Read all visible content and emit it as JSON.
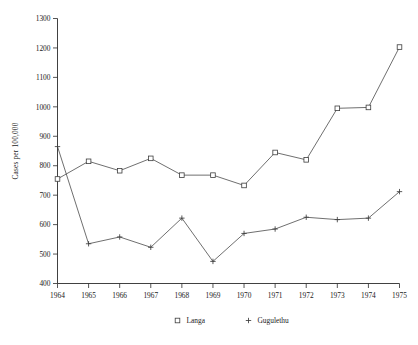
{
  "chart_data": {
    "type": "line",
    "title": "",
    "xlabel": "",
    "ylabel": "Cases per 100,000",
    "x": [
      1964,
      1965,
      1966,
      1967,
      1968,
      1969,
      1970,
      1971,
      1972,
      1973,
      1974,
      1975
    ],
    "categories": [
      "1964",
      "1965",
      "1966",
      "1967",
      "1968",
      "1969",
      "1970",
      "1971",
      "1972",
      "1973",
      "1974",
      "1975"
    ],
    "xlim": [
      1964,
      1975
    ],
    "ylim": [
      400,
      1300
    ],
    "ytick_labels": [
      "400",
      "500",
      "600",
      "700",
      "800",
      "900",
      "1000",
      "1100",
      "1200",
      "1300"
    ],
    "ytick_values": [
      400,
      500,
      600,
      700,
      800,
      900,
      1000,
      1100,
      1200,
      1300
    ],
    "grid": false,
    "legend_position": "bottom",
    "series": [
      {
        "name": "Langa",
        "marker": "square",
        "values": [
          755,
          815,
          783,
          825,
          768,
          768,
          733,
          845,
          820,
          995,
          998,
          1203
        ]
      },
      {
        "name": "Gugulethu",
        "marker": "plus",
        "values": [
          865,
          535,
          558,
          523,
          622,
          475,
          570,
          585,
          625,
          617,
          622,
          712
        ]
      }
    ]
  },
  "legend": {
    "entries": [
      {
        "label": "Langa",
        "marker": "square-marker"
      },
      {
        "label": "Gugulethu",
        "marker": "plus-marker"
      }
    ]
  }
}
